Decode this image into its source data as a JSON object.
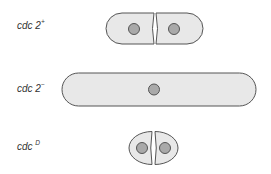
{
  "diagram": {
    "title": "",
    "colors": {
      "cell_fill": "#e8e8e8",
      "cell_stroke": "#555555",
      "nucleus_fill": "#a9a9a9",
      "nucleus_stroke": "#555555",
      "label_text": "#333333"
    },
    "rows": [
      {
        "id": "wild-type",
        "label_base": "cdc 2",
        "label_superscript": "+",
        "description": "two normal-length daughter cells dividing, each with one nucleus"
      },
      {
        "id": "mutant-minus",
        "label_base": "cdc 2",
        "label_superscript": "−",
        "description": "single elongated cell with one central nucleus"
      },
      {
        "id": "dominant",
        "label_base": "cdc ",
        "label_superscript": "D",
        "description": "two small daughter cells dividing, each with one nucleus"
      }
    ]
  }
}
